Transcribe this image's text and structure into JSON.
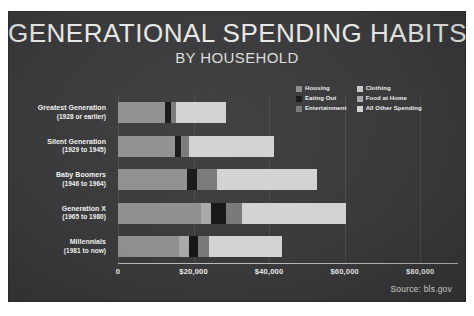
{
  "poster": {
    "title": "GENERATIONAL SPENDING HABITS",
    "subtitle": "BY HOUSEHOLD",
    "source": "Source: bls.gov",
    "background_color": "#3a3a3c"
  },
  "legend": {
    "columns": [
      [
        {
          "label": "Housing",
          "color": "#8f8f8f"
        },
        {
          "label": "Eating Out",
          "color": "#151515"
        },
        {
          "label": "Entertainment",
          "color": "#787878"
        }
      ],
      [
        {
          "label": "Clothing",
          "color": "#c9c9c7"
        },
        {
          "label": "Food at Home",
          "color": "#a8a8a6"
        },
        {
          "label": "All Other Spending",
          "color": "#d2d2d0"
        }
      ]
    ]
  },
  "chart_data": {
    "type": "bar",
    "orientation": "horizontal",
    "stacked": true,
    "title": "GENERATIONAL SPENDING HABITS",
    "subtitle": "BY HOUSEHOLD",
    "xlabel": "",
    "ylabel": "",
    "xlim": [
      0,
      90000
    ],
    "grid": true,
    "legend_position": "top-right",
    "xticks": [
      0,
      20000,
      40000,
      60000,
      80000
    ],
    "xticklabels": [
      "0",
      "$20,000",
      "$40,000",
      "$60,000",
      "$80,000"
    ],
    "categories": [
      "Greatest Generation",
      "Silent Generation",
      "Baby Boomers",
      "Generation X",
      "Millennials"
    ],
    "category_sublabels": [
      "(1928 or earlier)",
      "(1929 to 1945)",
      "(1946 to 1964)",
      "(1965 to 1980)",
      "(1981 to now)"
    ],
    "series": [
      {
        "name": "Housing",
        "color": "#8f8f8f",
        "values": [
          12400,
          15000,
          18300,
          22100,
          16200
        ]
      },
      {
        "name": "Food at Home",
        "color": "#a8a8a6",
        "values": [
          0,
          0,
          0,
          2600,
          2600
        ]
      },
      {
        "name": "Eating Out",
        "color": "#151515",
        "values": [
          1500,
          1800,
          2600,
          3800,
          2400
        ]
      },
      {
        "name": "Entertainment",
        "color": "#787878",
        "values": [
          1500,
          2100,
          5300,
          4400,
          2900
        ]
      },
      {
        "name": "All Other Spending",
        "color": "#d2d2d0",
        "values": [
          13200,
          22400,
          26500,
          27400,
          19400
        ]
      }
    ],
    "totals": [
      28600,
      41300,
      52700,
      60300,
      43500
    ]
  }
}
